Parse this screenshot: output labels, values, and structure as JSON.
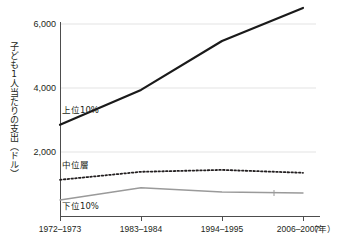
{
  "chart_data": {
    "type": "line",
    "title": "",
    "xlabel": "年",
    "ylabel": "子ども1人当たりの支出（ドル）",
    "categories": [
      "1972–1973",
      "1983–1984",
      "1994–1995",
      "2006–2007"
    ],
    "ytick_labels": [
      "2,000",
      "4,000",
      "6,000"
    ],
    "ytick_values": [
      2000,
      4000,
      6000
    ],
    "ylim": [
      0,
      6600
    ],
    "grid": "horizontal",
    "legend": "inline-annotations",
    "series": [
      {
        "name": "上位10%",
        "style": "solid-thick-black",
        "color": "#1a1a1a",
        "values": [
          2850,
          3940,
          5470,
          6500
        ]
      },
      {
        "name": "中位層",
        "style": "dotted-black",
        "color": "#231f20",
        "values": [
          1130,
          1380,
          1440,
          1350
        ]
      },
      {
        "name": "下位10%",
        "style": "solid-thin-gray",
        "color": "#9a9a9a",
        "values": [
          500,
          880,
          750,
          720
        ]
      }
    ],
    "annotations": [
      {
        "text": "上位10%",
        "x": 0.32,
        "y": 3300
      },
      {
        "text": "中位層",
        "x": 0.18,
        "y": 1750
      },
      {
        "text": "下位10%",
        "x": 0.22,
        "y": 330
      }
    ]
  },
  "axis": {
    "x_unit_suffix": "（年）",
    "y_title": "子ども1人当たりの支出（ドル）"
  },
  "colors": {
    "top_series": "#1a1a1a",
    "mid_series": "#231f20",
    "bottom_series": "#9a9a9a",
    "gridline": "#e3e3e3",
    "axis": "#4d4d4d",
    "text": "#231f20",
    "background": "#ffffff"
  }
}
